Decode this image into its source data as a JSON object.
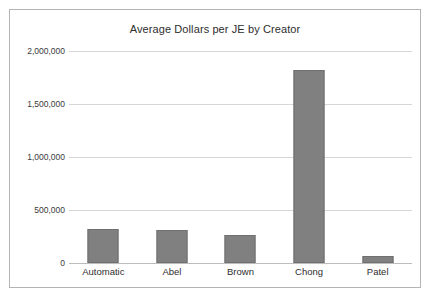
{
  "chart_data": {
    "type": "bar",
    "title": "Average Dollars per JE by Creator",
    "xlabel": "",
    "ylabel": "",
    "categories": [
      "Automatic",
      "Abel",
      "Brown",
      "Chong",
      "Patel"
    ],
    "values": [
      320000,
      315000,
      265000,
      1820000,
      65000
    ],
    "ylim": [
      0,
      2000000
    ],
    "yticks": [
      0,
      500000,
      1000000,
      1500000,
      2000000
    ],
    "ytick_labels": [
      "0",
      "500,000",
      "1,000,000",
      "1,500,000",
      "2,000,000"
    ],
    "grid": true,
    "legend": null,
    "bar_color": "#808080",
    "bar_border_color": "#6f6f6f",
    "gridline_color": "#d6d6d6",
    "axis_color": "#bdbdbd",
    "frame_border_color": "#b4b4b4",
    "background_color": "#ffffff",
    "text_color": "#2e2e2e"
  }
}
